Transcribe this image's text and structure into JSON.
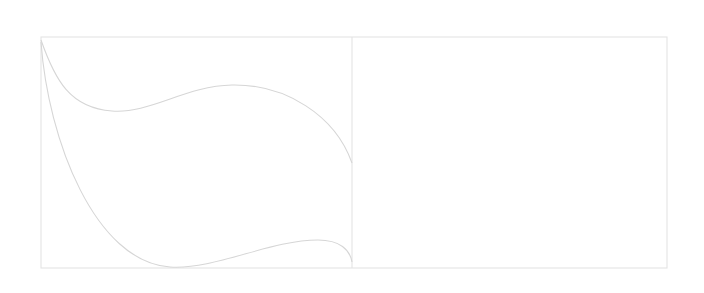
{
  "canvas": {
    "width": 704,
    "height": 293,
    "background": "#ffffff"
  },
  "style": {
    "stroke_color": "#d6d6d6",
    "frame_color": "#e4e4e4",
    "stroke_width": 1.1
  },
  "frame": {
    "x": 41,
    "y": 37,
    "width": 626,
    "height": 231
  },
  "divider": {
    "x": 352,
    "y1": 37,
    "y2": 268
  },
  "panels": [
    {
      "name": "left-panel",
      "content": "wave-shape"
    },
    {
      "name": "right-panel",
      "content": "empty"
    }
  ],
  "shapes": {
    "upper_curve": "M41,40 C55,80 70,108 112,111 C150,114 185,86 232,85 C285,84 335,115 352,163",
    "lower_curve": "M41,42 C48,140 95,262 170,267 C215,270 270,240 318,240 C340,240 350,250 352,262"
  }
}
